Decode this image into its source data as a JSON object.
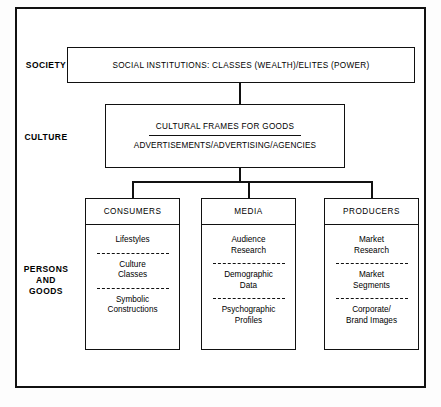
{
  "diagram": {
    "rows": [
      {
        "id": "society",
        "label": "SOCIETY"
      },
      {
        "id": "culture",
        "label": "CULTURE"
      },
      {
        "id": "persons_goods",
        "label": "PERSONS\nAND\nGOODS"
      }
    ],
    "society_box": {
      "text": "SOCIAL INSTITUTIONS:  CLASSES (WEALTH)/ELITES (POWER)"
    },
    "culture_box": {
      "line1": "CULTURAL FRAMES FOR GOODS",
      "line2": "ADVERTISEMENTS/ADVERTISING/AGENCIES"
    },
    "columns": [
      {
        "id": "consumers",
        "header": "CONSUMERS",
        "items": [
          "Lifestyles",
          "Culture\nClasses",
          "Symbolic\nConstructions"
        ]
      },
      {
        "id": "media",
        "header": "MEDIA",
        "items": [
          "Audience\nResearch",
          "Demographic\nData",
          "Psychographic\nProfiles"
        ]
      },
      {
        "id": "producers",
        "header": "PRODUCERS",
        "items": [
          "Market\nResearch",
          "Market\nSegments",
          "Corporate/\nBrand Images"
        ]
      }
    ],
    "colors": {
      "ink": "#111111",
      "paper": "#ffffff"
    }
  }
}
